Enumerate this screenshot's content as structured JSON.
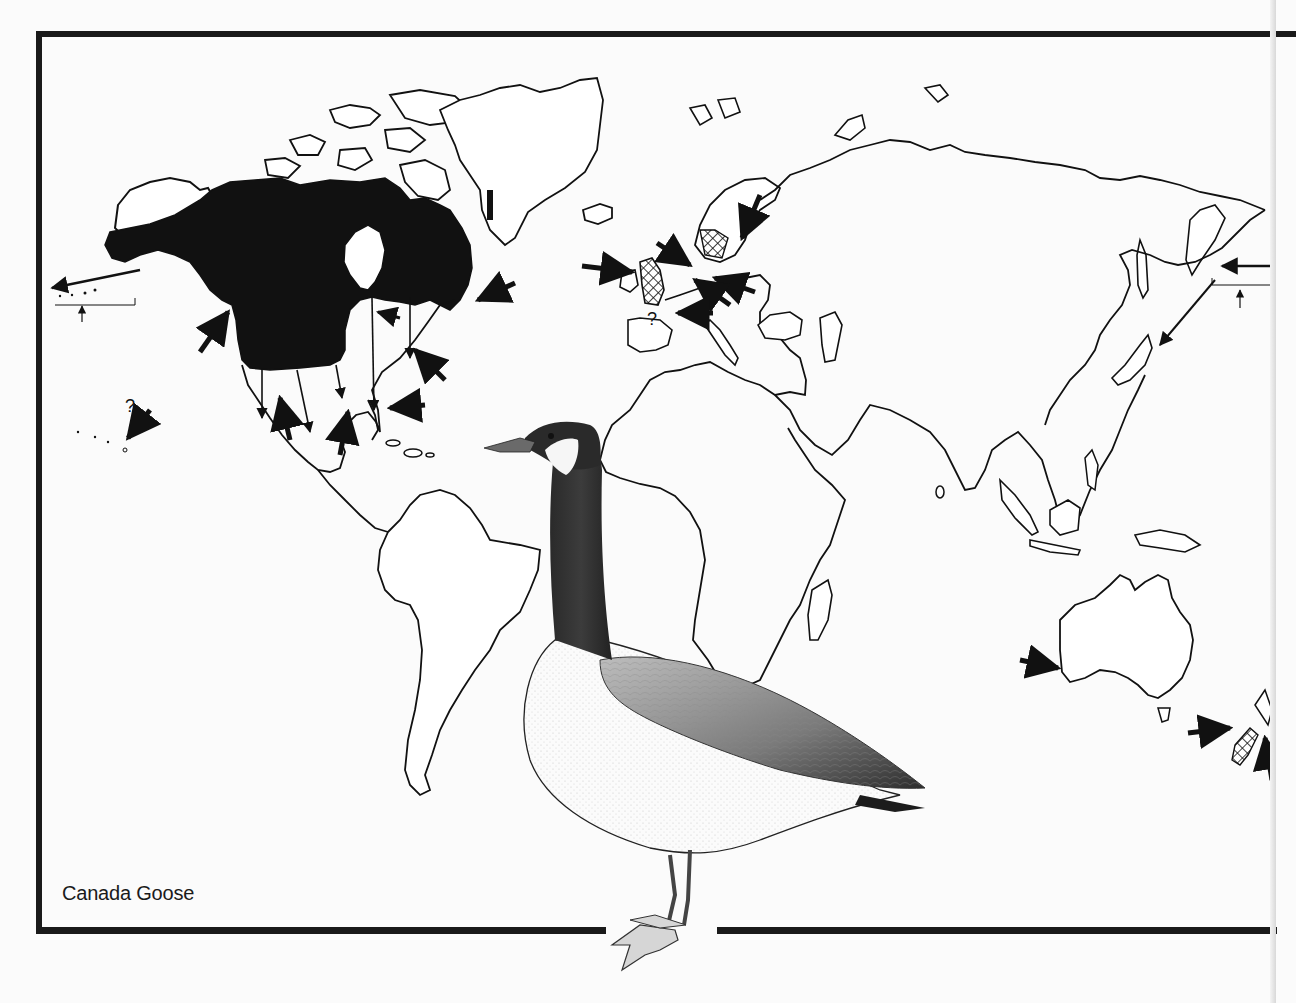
{
  "figure": {
    "type": "species-distribution-map",
    "caption": "Canada Goose",
    "species_illustration": "Canada Goose (standing, side view)"
  },
  "legend_symbols": {
    "breeding_range": {
      "style": "solid black fill",
      "color": "#111111"
    },
    "introduced_range": {
      "style": "cross-hatch",
      "color": "#111111"
    },
    "migration_arrow": {
      "style": "thin-shaft arrow"
    },
    "vagrant_arrow": {
      "style": "double-fletched bold arrow"
    },
    "uncertain_marker": "?"
  },
  "map": {
    "regions": [
      {
        "name": "North America",
        "range": "breeding (solid fill)"
      },
      {
        "name": "Great Britain",
        "range": "introduced (hatched)"
      },
      {
        "name": "Scandinavia",
        "range": "introduced (hatched)"
      },
      {
        "name": "New Zealand",
        "range": "introduced (hatched)"
      }
    ],
    "question_marks": [
      {
        "location": "Hawaii",
        "text": "?"
      },
      {
        "location": "France",
        "text": "?"
      }
    ],
    "arrows": [
      {
        "location": "Aleutians westward",
        "kind": "migration"
      },
      {
        "location": "Pacific NW coast",
        "kind": "vagrant"
      },
      {
        "location": "Hawaii",
        "kind": "vagrant"
      },
      {
        "location": "North America southward (multiple)",
        "kind": "migration"
      },
      {
        "location": "Mexico",
        "kind": "vagrant"
      },
      {
        "location": "Atlantic coast / Newfoundland",
        "kind": "vagrant"
      },
      {
        "location": "Florida",
        "kind": "vagrant"
      },
      {
        "location": "Ireland / Britain",
        "kind": "vagrant"
      },
      {
        "location": "Denmark / Netherlands",
        "kind": "vagrant"
      },
      {
        "location": "Baltic / Finland",
        "kind": "vagrant"
      },
      {
        "location": "France",
        "kind": "vagrant"
      },
      {
        "location": "Kamchatka / Japan",
        "kind": "migration"
      },
      {
        "location": "Commander Islands",
        "kind": "migration"
      },
      {
        "location": "Western Australia",
        "kind": "vagrant"
      },
      {
        "location": "New Zealand",
        "kind": "vagrant"
      }
    ]
  },
  "colors": {
    "background": "#fbfbfb",
    "ink": "#111111",
    "frame": "#1a1a1a"
  }
}
